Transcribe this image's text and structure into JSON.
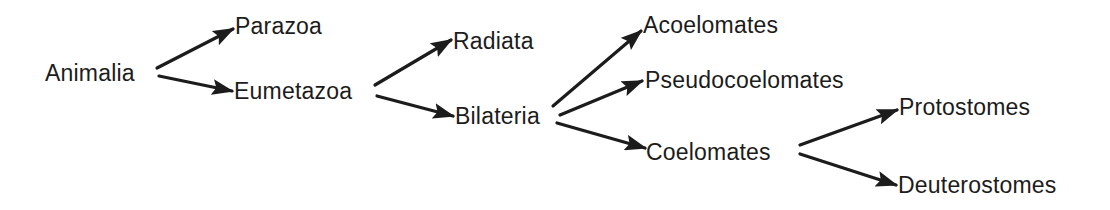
{
  "diagram": {
    "type": "tree",
    "direction": "left-to-right",
    "colors": {
      "text": "#1c1c1c",
      "edge": "#1c1c1c",
      "background": "#ffffff"
    },
    "nodes": [
      {
        "id": "animalia",
        "label": "Animalia",
        "x": 45,
        "y": 73
      },
      {
        "id": "parazoa",
        "label": "Parazoa",
        "x": 235,
        "y": 26
      },
      {
        "id": "eumetazoa",
        "label": "Eumetazoa",
        "x": 234,
        "y": 91
      },
      {
        "id": "radiata",
        "label": "Radiata",
        "x": 453,
        "y": 41
      },
      {
        "id": "bilateria",
        "label": "Bilateria",
        "x": 455,
        "y": 116
      },
      {
        "id": "acoelomates",
        "label": "Acoelomates",
        "x": 643,
        "y": 25
      },
      {
        "id": "pseudocoelomates",
        "label": "Pseudocoelomates",
        "x": 645,
        "y": 80
      },
      {
        "id": "coelomates",
        "label": "Coelomates",
        "x": 646,
        "y": 152
      },
      {
        "id": "protostomes",
        "label": "Protostomes",
        "x": 899,
        "y": 107
      },
      {
        "id": "deuterostomes",
        "label": "Deuterostomes",
        "x": 898,
        "y": 185
      }
    ],
    "edges": [
      {
        "from": "animalia",
        "to": "parazoa",
        "x1": 157,
        "y1": 68,
        "x2": 233,
        "y2": 29
      },
      {
        "from": "animalia",
        "to": "eumetazoa",
        "x1": 159,
        "y1": 76,
        "x2": 232,
        "y2": 91
      },
      {
        "from": "eumetazoa",
        "to": "radiata",
        "x1": 375,
        "y1": 85,
        "x2": 451,
        "y2": 40
      },
      {
        "from": "eumetazoa",
        "to": "bilateria",
        "x1": 377,
        "y1": 96,
        "x2": 453,
        "y2": 116
      },
      {
        "from": "bilateria",
        "to": "acoelomates",
        "x1": 553,
        "y1": 106,
        "x2": 641,
        "y2": 31
      },
      {
        "from": "bilateria",
        "to": "pseudocoelomates",
        "x1": 560,
        "y1": 115,
        "x2": 642,
        "y2": 81
      },
      {
        "from": "bilateria",
        "to": "coelomates",
        "x1": 557,
        "y1": 123,
        "x2": 645,
        "y2": 148
      },
      {
        "from": "coelomates",
        "to": "protostomes",
        "x1": 800,
        "y1": 145,
        "x2": 897,
        "y2": 110
      },
      {
        "from": "coelomates",
        "to": "deuterostomes",
        "x1": 800,
        "y1": 154,
        "x2": 896,
        "y2": 185
      }
    ]
  }
}
